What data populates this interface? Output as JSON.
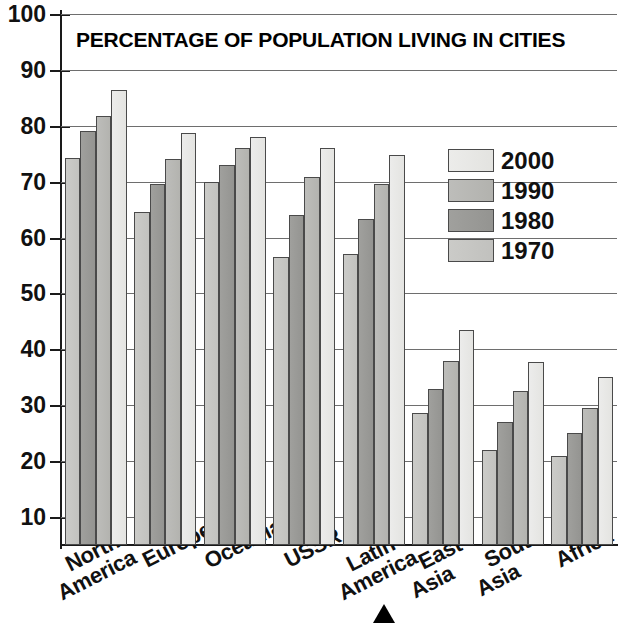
{
  "chart_data": {
    "type": "bar",
    "title": "PERCENTAGE OF POPULATION LIVING IN CITIES",
    "xlabel": "",
    "ylabel": "",
    "ylim": [
      5,
      100
    ],
    "yticks": [
      10,
      20,
      30,
      40,
      50,
      60,
      70,
      80,
      90,
      100
    ],
    "grid": true,
    "legend_position": "inside-right",
    "categories": [
      "North America",
      "Europe",
      "Oceania",
      "USSR",
      "Latin America",
      "East Asia",
      "South Asia",
      "Africa"
    ],
    "series": [
      {
        "name": "1970",
        "color": "#c8c8c5",
        "values": [
          74.2,
          64.5,
          70.0,
          56.5,
          57.0,
          28.7,
          22.0,
          21.0
        ]
      },
      {
        "name": "1980",
        "color": "#9a9a97",
        "values": [
          79.0,
          69.5,
          73.0,
          64.0,
          63.3,
          33.0,
          27.0,
          25.0
        ]
      },
      {
        "name": "1990",
        "color": "#b8b8b5",
        "values": [
          81.8,
          74.1,
          76.0,
          70.8,
          69.6,
          38.0,
          32.5,
          29.5
        ]
      },
      {
        "name": "2000",
        "color": "#e8e8e6",
        "values": [
          86.4,
          78.8,
          78.0,
          76.0,
          74.7,
          43.5,
          37.8,
          35.0
        ]
      }
    ],
    "annotations": [
      {
        "name": "pointer-marker",
        "target": "Latin America",
        "glyph": "triangle-up"
      }
    ]
  },
  "legend": {
    "items": [
      {
        "label": "2000",
        "series": "s2000"
      },
      {
        "label": "1990",
        "series": "s1990"
      },
      {
        "label": "1980",
        "series": "s1980"
      },
      {
        "label": "1970",
        "series": "s1970"
      }
    ]
  },
  "axis": {
    "y_tick_labels": [
      "100",
      "90",
      "80",
      "70",
      "60",
      "50",
      "40",
      "30",
      "20",
      "10"
    ]
  },
  "categories_display": [
    {
      "line1": "North",
      "line2": "America"
    },
    {
      "line1": "Europe",
      "line2": ""
    },
    {
      "line1": "Oceania",
      "line2": ""
    },
    {
      "line1": "USSR",
      "line2": ""
    },
    {
      "line1": "Latin",
      "line2": "America"
    },
    {
      "line1": "East",
      "line2": "Asia"
    },
    {
      "line1": "South",
      "line2": "Asia"
    },
    {
      "line1": "Africa",
      "line2": ""
    }
  ]
}
